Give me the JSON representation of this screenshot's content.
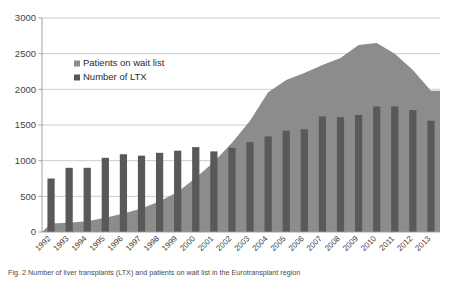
{
  "figure": {
    "caption": "Fig. 2  Number of liver transplants (LTX) and patients on wait list in the Eurotransplant region"
  },
  "legend": {
    "position": "inside-top-left",
    "entries": [
      {
        "label": "Patients on wait list",
        "color": "#8c8c8c",
        "marker": "square"
      },
      {
        "label": "Number of LTX",
        "color": "#595959",
        "marker": "square"
      }
    ]
  },
  "chart_data": {
    "type": "bar",
    "title": "",
    "xlabel": "",
    "ylabel": "",
    "ylim": [
      0,
      3000
    ],
    "ytick_step": 500,
    "yticks": [
      0,
      500,
      1000,
      1500,
      2000,
      2500,
      3000
    ],
    "ytick_labels": [
      "0",
      "500",
      "1000",
      "1500",
      "2000",
      "2500",
      "3000"
    ],
    "grid": true,
    "grid_axis": "y",
    "categories": [
      "1992",
      "1993",
      "1994",
      "1995",
      "1996",
      "1997",
      "1998",
      "1999",
      "2000",
      "2001",
      "2002",
      "2003",
      "2004",
      "2005",
      "2006",
      "2007",
      "2008",
      "2009",
      "2010",
      "2011",
      "2012",
      "2013"
    ],
    "series": [
      {
        "name": "Patients on wait list",
        "type": "area",
        "color": "#8c8c8c",
        "values": [
          120,
          130,
          150,
          200,
          260,
          330,
          430,
          560,
          760,
          980,
          1250,
          1560,
          1960,
          2130,
          2230,
          2340,
          2440,
          2620,
          2650,
          2500,
          2270,
          1980
        ]
      },
      {
        "name": "Number of LTX",
        "type": "bar",
        "color": "#595959",
        "values": [
          750,
          900,
          900,
          1040,
          1090,
          1070,
          1110,
          1140,
          1190,
          1130,
          1180,
          1260,
          1340,
          1420,
          1440,
          1620,
          1610,
          1640,
          1760,
          1760,
          1710,
          1560
        ]
      }
    ],
    "axis_ranges": {
      "x": [
        "1992",
        "2013"
      ],
      "y": [
        0,
        3000
      ]
    }
  }
}
